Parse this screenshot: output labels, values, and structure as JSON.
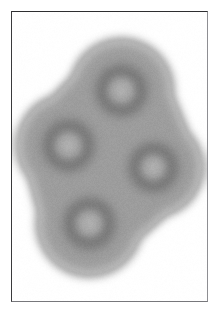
{
  "figure": {
    "kind": "grayscale-micrograph",
    "title": "",
    "caption": "",
    "background_color": "#ffffff",
    "frame": {
      "name": "plate-frame",
      "left": 11,
      "top": 11,
      "width": 197,
      "height": 291,
      "border_top_color": "#2e2e30",
      "border_left_color": "#3a3a3c",
      "border_right_color": "#8e8e92",
      "border_bottom_color": "#77777b",
      "border_width": 1
    },
    "canvas": {
      "width": 195,
      "height": 289
    }
  },
  "specimen": {
    "name": "four-lobed-diffuse-cluster",
    "description": "Four overlapping soft-edged circular lobes forming a rhombic cluster oriented from lower-left to upper-right, each lobe showing a darker annular ring with a lighter core.",
    "cluster_tone": {
      "halo_gray": "#b4b4b4",
      "body_gray": "#a3a3a3",
      "ridge_gray": "#949494",
      "ring_gray": "#8a8a8a",
      "ring_dark_gray": "#7f7f7f",
      "core_gray": "#b2b2b2",
      "core_light_gray": "#bcbcbc",
      "paper_gray": "#ffffff"
    },
    "blur_radius_px": 9,
    "lobes": [
      {
        "id": "lobe-top-right",
        "label": "top-right lobe",
        "cx": 109,
        "cy": 78,
        "lobe_radius": 47,
        "ring_outer_radius": 24,
        "ring_inner_radius": 15,
        "core_radius": 14
      },
      {
        "id": "lobe-left",
        "label": "left lobe",
        "cx": 56,
        "cy": 133,
        "lobe_radius": 47,
        "ring_outer_radius": 24,
        "ring_inner_radius": 15,
        "core_radius": 14
      },
      {
        "id": "lobe-right",
        "label": "right lobe",
        "cx": 141,
        "cy": 155,
        "lobe_radius": 45,
        "ring_outer_radius": 23,
        "ring_inner_radius": 14,
        "core_radius": 13
      },
      {
        "id": "lobe-bottom",
        "label": "bottom lobe",
        "cx": 77,
        "cy": 211,
        "lobe_radius": 48,
        "ring_outer_radius": 24,
        "ring_inner_radius": 15,
        "core_radius": 14
      }
    ],
    "bridges": [
      {
        "id": "bridge-top-left",
        "x1": 109,
        "y1": 78,
        "x2": 56,
        "y2": 133,
        "half_width": 40
      },
      {
        "id": "bridge-top-right",
        "x1": 109,
        "y1": 78,
        "x2": 141,
        "y2": 155,
        "half_width": 40
      },
      {
        "id": "bridge-left-bottom",
        "x1": 56,
        "y1": 133,
        "x2": 77,
        "y2": 211,
        "half_width": 41
      },
      {
        "id": "bridge-right-bottom",
        "x1": 141,
        "y1": 155,
        "x2": 77,
        "y2": 211,
        "half_width": 39
      },
      {
        "id": "bridge-diagonal",
        "x1": 56,
        "y1": 133,
        "x2": 141,
        "y2": 155,
        "half_width": 34
      }
    ],
    "grain": {
      "enabled": true,
      "amplitude": 7
    }
  }
}
